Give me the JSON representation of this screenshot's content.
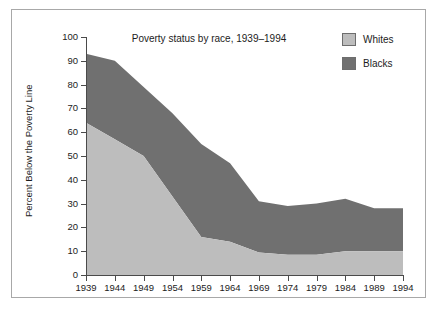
{
  "figure": {
    "title": "Poverty status by race, 1939–1994",
    "y_axis_title": "Percent Below the Poverty Line"
  },
  "legend": {
    "position": "top-right",
    "items": [
      {
        "label": "Whites",
        "color": "#bdbdbd",
        "name": "legend-item-whites"
      },
      {
        "label": "Blacks",
        "color": "#707070",
        "name": "legend-item-blacks"
      }
    ]
  },
  "axes": {
    "y_ticks": [
      "100",
      "90",
      "80",
      "70",
      "60",
      "50",
      "40",
      "30",
      "20",
      "10",
      "0"
    ],
    "x_ticks": [
      "1939",
      "1944",
      "1949",
      "1954",
      "1959",
      "1964",
      "1969",
      "1974",
      "1979",
      "1984",
      "1989",
      "1994"
    ]
  },
  "colors": {
    "whites_fill": "#bdbdbd",
    "blacks_fill": "#707070",
    "axis": "#4a4a4a",
    "frame": "#a8a8a8",
    "text": "#1c1c1c",
    "background": "#ffffff"
  },
  "chart_data": {
    "type": "area",
    "stacked": true,
    "title": "Poverty status by race, 1939–1994",
    "xlabel": "",
    "ylabel": "Percent Below the Poverty Line",
    "xlim": [
      1939,
      1994
    ],
    "ylim": [
      0,
      100
    ],
    "ytick_interval": 10,
    "xtick_interval": 5,
    "grid": false,
    "legend_position": "top-right",
    "categories": [
      1939,
      1944,
      1949,
      1954,
      1959,
      1964,
      1969,
      1974,
      1979,
      1984,
      1989,
      1994
    ],
    "series": [
      {
        "name": "Whites",
        "color": "#bdbdbd",
        "stack_order": 0,
        "values": [
          64,
          57,
          50,
          33,
          16,
          14,
          9.5,
          8.5,
          8.5,
          10,
          10,
          10
        ]
      },
      {
        "name": "Blacks",
        "color": "#707070",
        "stack_order": 1,
        "note": "band height = cumulative total minus Whites",
        "values": [
          29,
          33,
          29,
          35,
          39,
          33,
          21.5,
          20.5,
          21.5,
          22,
          18,
          18
        ]
      }
    ],
    "cumulative_totals": [
      93,
      90,
      79,
      68,
      55,
      47,
      31,
      29,
      30,
      32,
      28,
      28
    ]
  }
}
